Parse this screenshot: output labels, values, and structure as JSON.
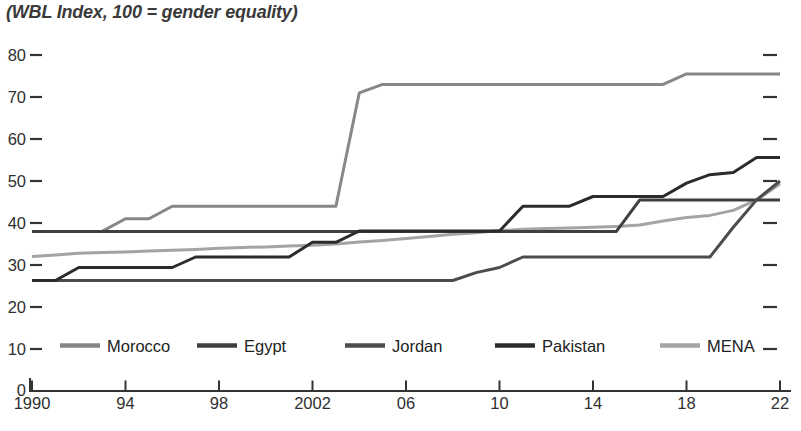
{
  "chart_data": {
    "type": "line",
    "title": "(WBL Index, 100 = gender equality)",
    "x_axis": {
      "range": [
        1990,
        2022
      ],
      "ticks": [
        {
          "year": 1990,
          "label": "1990"
        },
        {
          "year": 1994,
          "label": "94"
        },
        {
          "year": 1998,
          "label": "98"
        },
        {
          "year": 2002,
          "label": "2002"
        },
        {
          "year": 2006,
          "label": "06"
        },
        {
          "year": 2010,
          "label": "10"
        },
        {
          "year": 2014,
          "label": "14"
        },
        {
          "year": 2018,
          "label": "18"
        },
        {
          "year": 2022,
          "label": "22"
        }
      ]
    },
    "y_axis": {
      "range": [
        0,
        80
      ],
      "ticks": [
        10,
        20,
        30,
        40,
        50,
        60,
        70,
        80
      ],
      "zero_label": "0",
      "right_ticks_mirrored": true,
      "grid": false
    },
    "years": [
      1990,
      1991,
      1992,
      1993,
      1994,
      1995,
      1996,
      1997,
      1998,
      1999,
      2000,
      2001,
      2002,
      2003,
      2004,
      2005,
      2006,
      2007,
      2008,
      2009,
      2010,
      2011,
      2012,
      2013,
      2014,
      2015,
      2016,
      2017,
      2018,
      2019,
      2020,
      2021,
      2022
    ],
    "series": [
      {
        "name": "Morocco",
        "color": "#878787",
        "values": [
          38,
          38,
          38,
          38,
          41,
          41,
          44,
          44,
          44,
          44,
          44,
          44,
          44,
          44,
          71,
          73,
          73,
          73,
          73,
          73,
          73,
          73,
          73,
          73,
          73,
          73,
          73,
          73,
          75.5,
          75.5,
          75.5,
          75.5,
          75.5
        ]
      },
      {
        "name": "Egypt",
        "color": "#3f3f3f",
        "values": [
          38,
          38,
          38,
          38,
          38,
          38,
          38,
          38,
          38,
          38,
          38,
          38,
          38,
          38,
          38,
          38,
          38,
          38,
          38,
          38,
          38,
          38,
          38,
          38,
          38,
          38,
          45.5,
          45.5,
          45.5,
          45.5,
          45.5,
          45.5,
          45.5
        ]
      },
      {
        "name": "Jordan",
        "color": "#4c4c4c",
        "values": [
          26.3,
          26.3,
          26.3,
          26.3,
          26.3,
          26.3,
          26.3,
          26.3,
          26.3,
          26.3,
          26.3,
          26.3,
          26.3,
          26.3,
          26.3,
          26.3,
          26.3,
          26.3,
          26.3,
          28.2,
          29.4,
          31.9,
          31.9,
          31.9,
          31.9,
          31.9,
          31.9,
          31.9,
          31.9,
          31.9,
          39,
          45.5,
          50
        ]
      },
      {
        "name": "Pakistan",
        "color": "#2b2b2b",
        "values": [
          26.3,
          26.3,
          29.4,
          29.4,
          29.4,
          29.4,
          29.4,
          31.9,
          31.9,
          31.9,
          31.9,
          31.9,
          35.4,
          35.4,
          38.1,
          38.1,
          38.1,
          38.1,
          38.1,
          38.1,
          38.1,
          44,
          44,
          44,
          46.3,
          46.3,
          46.3,
          46.3,
          49.5,
          51.5,
          52,
          55.6,
          55.6
        ]
      },
      {
        "name": "MENA",
        "color": "#a4a4a4",
        "values": [
          32,
          32.4,
          32.8,
          33,
          33.1,
          33.3,
          33.5,
          33.7,
          34,
          34.2,
          34.3,
          34.5,
          34.7,
          35,
          35.5,
          35.8,
          36.3,
          36.8,
          37.3,
          37.7,
          38.2,
          38.5,
          38.7,
          38.8,
          39,
          39.2,
          39.5,
          40.5,
          41.3,
          41.8,
          43,
          45.5,
          49.3
        ]
      }
    ],
    "legend": {
      "position": "inside-bottom",
      "labels": [
        "Morocco",
        "Egypt",
        "Jordan",
        "Pakistan",
        "MENA"
      ]
    },
    "axis_color": "#333333",
    "label_color": "#2f2f2f"
  }
}
